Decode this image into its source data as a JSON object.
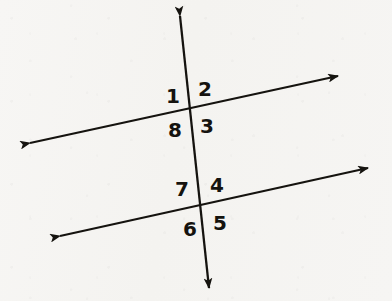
{
  "figure": {
    "background_color": "#f6f5f3",
    "ink_color": "#15130f",
    "stroke_width": 2.3,
    "width": 392,
    "height": 301,
    "lines": [
      {
        "name": "upper-parallel-line",
        "x1": 30,
        "y1": 143,
        "x2": 338,
        "y2": 76,
        "arrow_start": true,
        "arrow_end": true
      },
      {
        "name": "lower-parallel-line",
        "x1": 60,
        "y1": 236,
        "x2": 368,
        "y2": 168,
        "arrow_start": true,
        "arrow_end": true
      },
      {
        "name": "transversal-line",
        "x1": 180,
        "y1": 16,
        "x2": 209,
        "y2": 288,
        "arrow_start": true,
        "arrow_end": true
      }
    ],
    "intersections": [
      {
        "name": "upper-intersection",
        "x": 191,
        "y": 110
      },
      {
        "name": "lower-intersection",
        "x": 205,
        "y": 207
      }
    ],
    "angle_labels": [
      {
        "id": "1",
        "text": "1",
        "x": 173,
        "y": 96,
        "position": "upper-left"
      },
      {
        "id": "2",
        "text": "2",
        "x": 205,
        "y": 89,
        "position": "upper-right"
      },
      {
        "id": "3",
        "text": "3",
        "x": 207,
        "y": 126,
        "position": "lower-right"
      },
      {
        "id": "8",
        "text": "8",
        "x": 175,
        "y": 130,
        "position": "lower-left"
      },
      {
        "id": "7",
        "text": "7",
        "x": 182,
        "y": 189,
        "position": "upper-left"
      },
      {
        "id": "4",
        "text": "4",
        "x": 217,
        "y": 185,
        "position": "upper-right"
      },
      {
        "id": "5",
        "text": "5",
        "x": 220,
        "y": 223,
        "position": "lower-right"
      },
      {
        "id": "6",
        "text": "6",
        "x": 190,
        "y": 229,
        "position": "lower-left"
      }
    ]
  }
}
